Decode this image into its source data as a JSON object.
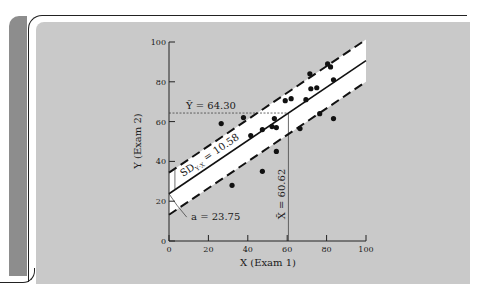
{
  "chart_data": {
    "type": "scatter",
    "title": "",
    "xlabel": "X (Exam 1)",
    "ylabel": "Y (Exam 2)",
    "xlim": [
      0,
      100
    ],
    "ylim": [
      0,
      100
    ],
    "x_ticks": [
      0,
      20,
      40,
      60,
      80,
      100
    ],
    "y_ticks": [
      0,
      20,
      40,
      60,
      80,
      100
    ],
    "grid": false,
    "points": [
      {
        "x": 26.5,
        "y": 59
      },
      {
        "x": 32,
        "y": 28
      },
      {
        "x": 37.8,
        "y": 62
      },
      {
        "x": 41.5,
        "y": 53
      },
      {
        "x": 47.4,
        "y": 56
      },
      {
        "x": 47.4,
        "y": 35
      },
      {
        "x": 52.3,
        "y": 57.5
      },
      {
        "x": 53.5,
        "y": 61.5
      },
      {
        "x": 54.5,
        "y": 57
      },
      {
        "x": 54.5,
        "y": 45
      },
      {
        "x": 59,
        "y": 70.5
      },
      {
        "x": 62,
        "y": 71.5
      },
      {
        "x": 66.5,
        "y": 56.5
      },
      {
        "x": 69.5,
        "y": 71
      },
      {
        "x": 71.5,
        "y": 84
      },
      {
        "x": 72,
        "y": 76.5
      },
      {
        "x": 75,
        "y": 77
      },
      {
        "x": 76.5,
        "y": 64
      },
      {
        "x": 80.5,
        "y": 89
      },
      {
        "x": 82,
        "y": 87.5
      },
      {
        "x": 83.5,
        "y": 81
      },
      {
        "x": 83.5,
        "y": 61.5
      }
    ],
    "regression": {
      "intercept": 23.75,
      "slope": 0.669,
      "sd_yx": 10.58
    },
    "annotations": {
      "y_mean_label": "Ȳ = 64.30",
      "y_mean": 64.3,
      "x_mean_label": "X̄ = 60.62",
      "x_mean": 60.62,
      "sd_label_main": "SD",
      "sd_label_sub": "Y·X",
      "sd_label_value": " = 10.58",
      "intercept_label": "a = 23.75"
    }
  }
}
